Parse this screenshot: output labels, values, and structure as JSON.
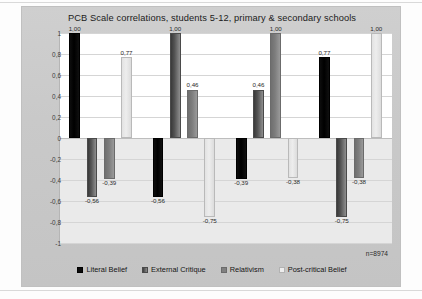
{
  "chart_data": {
    "type": "bar",
    "title": "PCB Scale correlations, students 5-12, primary & secondary schools",
    "xlabel": "",
    "ylabel": "",
    "ylim": [
      -1,
      1
    ],
    "grid": true,
    "legend_position": "bottom",
    "annotation": "n=8974",
    "categories": [
      "Literal Belief",
      "External Critique",
      "Relativism",
      "Post-critical Belief"
    ],
    "ytick_labels": [
      "1",
      "0,8",
      "0,6",
      "0,4",
      "0,2",
      "0",
      "-0,2",
      "-0,4",
      "-0,6",
      "-0,8",
      "-1"
    ],
    "ytick_values": [
      1,
      0.8,
      0.6,
      0.4,
      0.2,
      0,
      -0.2,
      -0.4,
      -0.6,
      -0.8,
      -1
    ],
    "series": [
      {
        "name": "Literal Belief",
        "values": [
          1.0,
          -0.56,
          -0.39,
          0.77
        ],
        "labels": [
          "1,00",
          "-0,56",
          "-0,39",
          "0,77"
        ]
      },
      {
        "name": "External Critique",
        "values": [
          -0.56,
          1.0,
          0.46,
          -0.75
        ],
        "labels": [
          "-0,56",
          "1,00",
          "0,46",
          "-0,75"
        ]
      },
      {
        "name": "Relativism",
        "values": [
          -0.39,
          0.46,
          1.0,
          -0.38
        ],
        "labels": [
          "-0,39",
          "0,46",
          "1,00",
          "-0,38"
        ]
      },
      {
        "name": "Post-critical Belief",
        "values": [
          0.77,
          -0.75,
          -0.38,
          1.0
        ],
        "labels": [
          "0,77",
          "-0,75",
          "-0,38",
          "1,00"
        ]
      }
    ],
    "colors": {
      "literal_belief": "#0a0a0a",
      "external_critique": "#545454",
      "relativism": "#808080",
      "post_critical_belief": "#ededed",
      "panel_background": "#c9c9c9",
      "plot_background": "#ffffff",
      "gridline": "#d5d5d5"
    }
  }
}
